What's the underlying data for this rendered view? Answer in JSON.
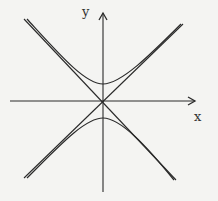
{
  "figure": {
    "axis_labels": {
      "x": "x",
      "y": "y"
    },
    "colors": {
      "background": "#f4f4f2",
      "stroke": "#2a2a2a"
    },
    "origin_px": [
      103,
      101
    ],
    "scale_px_per_unit": 17,
    "curve": {
      "type": "hyperbola",
      "equation": "y^2 - x^2 = 1",
      "a": 1,
      "b": 1,
      "opens": "vertical"
    },
    "asymptotes": [
      "y = x",
      "y = -x"
    ]
  }
}
